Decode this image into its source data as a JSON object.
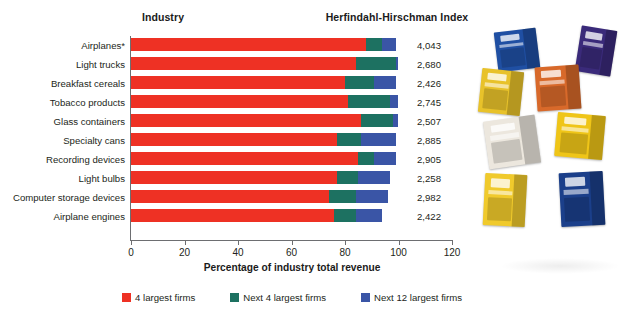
{
  "headers": {
    "industry": "Industry",
    "hhi": "Herfindahl-Hirschman Index"
  },
  "axis": {
    "x_title": "Percentage of industry total revenue",
    "ticks": [
      "0",
      "20",
      "40",
      "60",
      "80",
      "100",
      "120"
    ]
  },
  "legend": [
    {
      "label": "4 largest firms",
      "color": "#ee3124",
      "swatch": "sw-a"
    },
    {
      "label": "Next 4 largest firms",
      "color": "#1d7161",
      "swatch": "sw-b"
    },
    {
      "label": "Next 12 largest firms",
      "color": "#3a55a6",
      "swatch": "sw-c"
    }
  ],
  "photo": {
    "alt_name": "breakfast-cereal-boxes-photograph",
    "boxes": [
      {
        "name": "rice-krispies-blue-box",
        "color": "#1f4fa3",
        "left": 22,
        "top": 8,
        "w": 42,
        "h": 40,
        "rot": -7
      },
      {
        "name": "frosties-purple-box",
        "color": "#3a2a7a",
        "left": 104,
        "top": 6,
        "w": 36,
        "h": 46,
        "rot": 9
      },
      {
        "name": "coco-pops-yellow-box",
        "color": "#e8c22a",
        "left": 6,
        "top": 48,
        "w": 42,
        "h": 44,
        "rot": 6
      },
      {
        "name": "rice-krispies-orange-box",
        "color": "#d8692a",
        "left": 62,
        "top": 44,
        "w": 44,
        "h": 44,
        "rot": -4
      },
      {
        "name": "corn-flakes-white-box",
        "color": "#ece7de",
        "left": 12,
        "top": 96,
        "w": 52,
        "h": 48,
        "rot": -8
      },
      {
        "name": "crunchy-nut-yellow-box",
        "color": "#efc518",
        "left": 82,
        "top": 92,
        "w": 48,
        "h": 44,
        "rot": 5
      },
      {
        "name": "coco-pops-yellow-box-2",
        "color": "#f0ca2c",
        "left": 10,
        "top": 152,
        "w": 42,
        "h": 52,
        "rot": 3
      },
      {
        "name": "special-k-blue-box",
        "color": "#1b3f8a",
        "left": 86,
        "top": 150,
        "w": 44,
        "h": 54,
        "rot": -3
      }
    ]
  },
  "chart_data": {
    "type": "bar",
    "orientation": "horizontal",
    "stacked": true,
    "title": "",
    "xlabel": "Percentage of industry total revenue",
    "ylabel": "Industry",
    "xlim": [
      0,
      120
    ],
    "xticks": [
      0,
      20,
      40,
      60,
      80,
      100,
      120
    ],
    "grid": false,
    "legend_position": "bottom",
    "categories": [
      "Airplanes*",
      "Light trucks",
      "Breakfast cereals",
      "Tobacco products",
      "Glass containers",
      "Specialty cans",
      "Recording devices",
      "Light bulbs",
      "Computer storage devices",
      "Airplane engines"
    ],
    "series": [
      {
        "name": "4 largest firms",
        "color": "#ee3124",
        "values": [
          88,
          84,
          80,
          81,
          86,
          77,
          85,
          77,
          74,
          76
        ]
      },
      {
        "name": "Next 4 largest firms",
        "color": "#1d7161",
        "values": [
          6,
          15,
          11,
          16,
          12,
          9,
          6,
          8,
          10,
          8
        ]
      },
      {
        "name": "Next 12 largest firms",
        "color": "#3a55a6",
        "values": [
          5,
          1,
          8,
          3,
          2,
          13,
          8,
          12,
          12,
          10
        ]
      }
    ],
    "hhi_label": "Herfindahl-Hirschman Index",
    "hhi_values": [
      "4,043",
      "2,680",
      "2,426",
      "2,745",
      "2,507",
      "2,885",
      "2,905",
      "2,258",
      "2,982",
      "2,422"
    ],
    "footnote_marker": "*"
  }
}
